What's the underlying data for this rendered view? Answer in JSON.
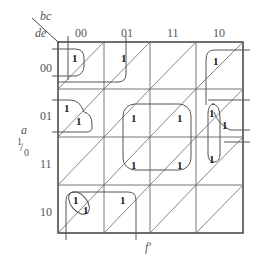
{
  "corner": {
    "col_vars": "bc",
    "row_vars": "de"
  },
  "columns": [
    "00",
    "01",
    "11",
    "10"
  ],
  "rows": [
    "00",
    "01",
    "11",
    "10"
  ],
  "side_variable": {
    "name": "a",
    "upper": "1",
    "lower": "0"
  },
  "bottom_label": "f′",
  "cell_value": "1",
  "ones": [
    {
      "row": 0,
      "col": 0,
      "half": "upper",
      "dx": 10,
      "dy": 12
    },
    {
      "row": 0,
      "col": 1,
      "half": "upper",
      "dx": 17,
      "dy": 12
    },
    {
      "row": 0,
      "col": 3,
      "half": "upper",
      "dx": 17,
      "dy": 14
    },
    {
      "row": 1,
      "col": 0,
      "half": "upper",
      "dx": 6,
      "dy": 14
    },
    {
      "row": 1,
      "col": 0,
      "half": "lower",
      "dx": 18,
      "dy": 28
    },
    {
      "row": 1,
      "col": 2,
      "half": "upper",
      "dx": 0,
      "dy": 0
    },
    {
      "row": 1,
      "col": 3,
      "half": "upper",
      "dx": 13,
      "dy": 18
    },
    {
      "row": 1,
      "col": 3,
      "half": "lower",
      "dx": 26,
      "dy": 30
    },
    {
      "row": 2,
      "col": 3,
      "half": "upper",
      "dx": 13,
      "dy": 15
    },
    {
      "row": 3,
      "col": 0,
      "half": "upper",
      "dx": 12,
      "dy": 10
    },
    {
      "row": 3,
      "col": 0,
      "half": "lower",
      "dx": 22,
      "dy": 20
    },
    {
      "row": 3,
      "col": 1,
      "half": "upper",
      "dx": 16,
      "dy": 10
    }
  ],
  "center_group_ones": [
    {
      "x": 131,
      "y": 113
    },
    {
      "x": 177,
      "y": 113
    },
    {
      "x": 131,
      "y": 160
    },
    {
      "x": 177,
      "y": 160
    }
  ],
  "colors": {
    "grid": "#444444",
    "diag": "#555555",
    "loop": "#555555",
    "text": "#222222"
  }
}
